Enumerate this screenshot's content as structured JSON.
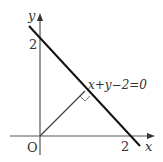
{
  "diagram": {
    "type": "coordinate-plane",
    "axes": {
      "x_label": "x",
      "y_label": "y",
      "origin_label": "O"
    },
    "ticks": {
      "x_intercept_label": "2",
      "y_intercept_label": "2"
    },
    "line": {
      "equation_label": "x+y−2=0",
      "x_intercept": 2,
      "y_intercept": 2
    },
    "perpendicular": {
      "from": "O",
      "foot": [
        1,
        1
      ],
      "right_angle_marker": true
    },
    "colors": {
      "axis": "#555555",
      "line": "#111111",
      "perpendicular": "#444444",
      "text": "#333333"
    }
  }
}
